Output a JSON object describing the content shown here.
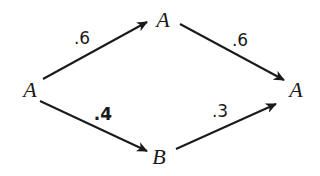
{
  "diagram": {
    "type": "probability-tree",
    "nodes": [
      {
        "id": "start",
        "label": "A",
        "x": 30,
        "y": 90
      },
      {
        "id": "top",
        "label": "A",
        "x": 163,
        "y": 20
      },
      {
        "id": "bottom",
        "label": "B",
        "x": 159,
        "y": 157
      },
      {
        "id": "end",
        "label": "A",
        "x": 296,
        "y": 90
      }
    ],
    "edges": [
      {
        "from": "start",
        "to": "top",
        "label": ".6",
        "x1": 43,
        "y1": 79,
        "x2": 147,
        "y2": 22,
        "label_x": 82,
        "label_y": 38
      },
      {
        "from": "top",
        "to": "end",
        "label": ".6",
        "x1": 180,
        "y1": 24,
        "x2": 284,
        "y2": 80,
        "label_x": 240,
        "label_y": 40
      },
      {
        "from": "start",
        "to": "bottom",
        "label": ".4",
        "x1": 40,
        "y1": 101,
        "x2": 147,
        "y2": 151,
        "label_x": 103,
        "label_y": 114
      },
      {
        "from": "bottom",
        "to": "end",
        "label": ".3",
        "x1": 176,
        "y1": 149,
        "x2": 276,
        "y2": 104,
        "label_x": 220,
        "label_y": 111
      }
    ],
    "colors": {
      "stroke": "#1a1a1a",
      "background": "#ffffff"
    }
  }
}
